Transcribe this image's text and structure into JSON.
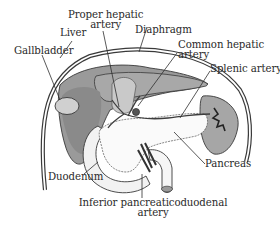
{
  "figure": {
    "type": "anatomical-diagram",
    "colors": {
      "organ_dark": "#8e8e8e",
      "organ_mid": "#b4b4b4",
      "organ_light": "#d6d6d6",
      "outline": "#3a3a3a",
      "vessel": "#4a4a4a",
      "pancreas": "#f4f4f4",
      "background": "#ffffff"
    }
  },
  "labels": {
    "proper_hepatic_artery": {
      "line1": "Proper hepatic",
      "line2": "artery"
    },
    "liver": "Liver",
    "diaphragm": "Diaphragm",
    "gallbladder": "Gallbladder",
    "common_hepatic_artery": {
      "line1": "Common hepatic",
      "line2": "artery"
    },
    "splenic_artery": "Splenic artery",
    "duodenum": "Duodenum",
    "pancreas": "Pancreas",
    "inferior_pancreaticoduodenal_artery": {
      "line1": "Inferior pancreaticoduodenal",
      "line2": "artery"
    }
  }
}
